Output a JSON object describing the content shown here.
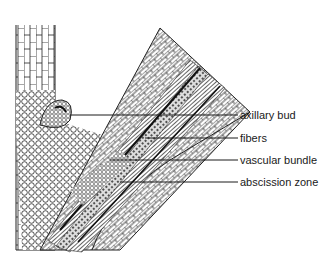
{
  "diagram": {
    "labels": [
      {
        "id": "axillary-bud",
        "text": "axillary bud",
        "y": 115,
        "line_x1": 70,
        "line_x2": 238
      },
      {
        "id": "fibers",
        "text": "fibers",
        "y": 138,
        "line_x1": 145,
        "line_x2": 238
      },
      {
        "id": "vascular-bundle",
        "text": "vascular bundle",
        "y": 160,
        "line_x1": 110,
        "line_x2": 238
      },
      {
        "id": "abscission-zone",
        "text": "abscission zone",
        "y": 182,
        "line_x1": 120,
        "line_x2": 238
      }
    ],
    "colors": {
      "ink": "#1a1a1a",
      "background": "#ffffff"
    }
  }
}
